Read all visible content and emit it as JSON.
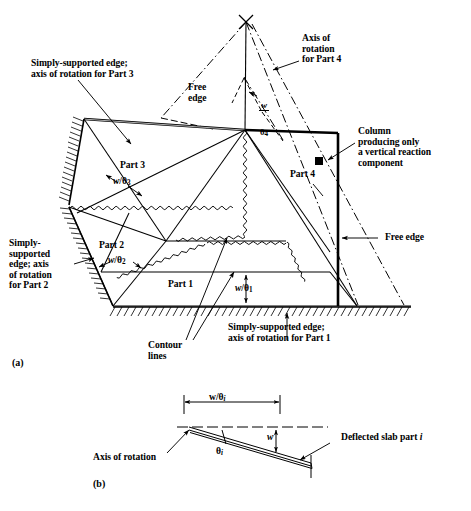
{
  "figure": {
    "panels": [
      {
        "tag": "(a)",
        "description": "Three-dimensional yield-line collapse mechanism of a slab divided into four rigid parts"
      },
      {
        "tag": "(b)",
        "description": "Section through a deflected slab part showing rotation angle and deflection"
      }
    ]
  },
  "panel_a": {
    "tag": "(a)",
    "callouts": [
      {
        "name": "simply-supported-part3",
        "text": "Simply-supported edge;\naxis of rotation for Part 3"
      },
      {
        "name": "axis-rotation-part4",
        "text": "Axis of\nrotation\nfor Part 4"
      },
      {
        "name": "column-note",
        "text": "Column\nproducing only\na vertical reaction\ncomponent"
      },
      {
        "name": "free-edge-right",
        "text": "Free edge"
      },
      {
        "name": "free-edge-upper",
        "text": "Free\nedge"
      },
      {
        "name": "simply-supported-part2",
        "text": "Simply-\nsupported\nedge; axis\nof rotation\nfor Part 2"
      },
      {
        "name": "simply-supported-part1",
        "text": "Simply-supported edge;\naxis of rotation for Part 1"
      },
      {
        "name": "contour-lines",
        "text": "Contour\nlines"
      }
    ],
    "part_labels": [
      {
        "name": "part-1",
        "text": "Part 1"
      },
      {
        "name": "part-2",
        "text": "Part 2"
      },
      {
        "name": "part-3",
        "text": "Part 3"
      },
      {
        "name": "part-4",
        "text": "Part 4"
      }
    ],
    "dimensions": [
      {
        "name": "w-over-theta-1",
        "numerator": "w",
        "denominator": "θ",
        "subscript": "1",
        "inline": "w/θ₁"
      },
      {
        "name": "w-over-theta-2",
        "numerator": "w",
        "denominator": "θ",
        "subscript": "2",
        "inline": "w/θ₂"
      },
      {
        "name": "w-over-theta-3",
        "numerator": "w",
        "denominator": "θ",
        "subscript": "3",
        "inline": "w/θ₃"
      },
      {
        "name": "w-over-theta-4",
        "numerator": "w",
        "denominator": "θ",
        "subscript": "4",
        "inline": "w/θ₄"
      }
    ]
  },
  "panel_b": {
    "tag": "(b)",
    "span_label": {
      "name": "w-over-theta-i",
      "text": "w/θ",
      "subscript": "i"
    },
    "deflection_label": {
      "name": "deflection-w",
      "text": "w"
    },
    "angle_label": {
      "name": "theta-i",
      "text": "θ",
      "subscript": "i"
    },
    "axis_label": {
      "name": "axis-of-rotation",
      "text": "Axis of rotation"
    },
    "slab_label": {
      "name": "deflected-slab-part",
      "text": "Deflected slab part ",
      "italic_suffix": "i"
    }
  },
  "style": {
    "ink": "#000000",
    "paper": "#ffffff",
    "line_light": "#1a1a1a"
  }
}
